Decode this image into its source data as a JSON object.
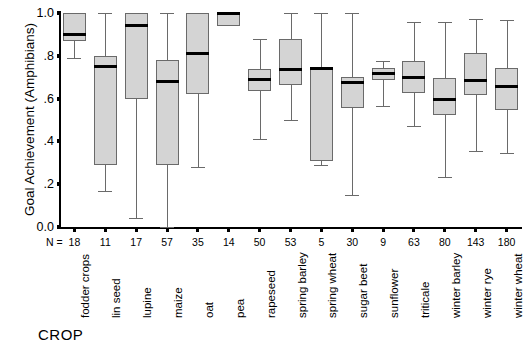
{
  "chart_data": {
    "type": "box",
    "title": "",
    "ylabel": "Goal Achievement (Amphibians)",
    "xlabel": "CROP",
    "ylim": [
      0.0,
      1.0
    ],
    "yticks": [
      "0.0",
      ".2",
      ".4",
      ".6",
      ".8",
      "1.0"
    ],
    "ytick_values": [
      0.0,
      0.2,
      0.4,
      0.6,
      0.8,
      1.0
    ],
    "grid": false,
    "legend": null,
    "n_prefix": "N =",
    "categories": [
      "fodder crops",
      "lin seed",
      "lupine",
      "maize",
      "oat",
      "pea",
      "rapeseed",
      "spring barley",
      "spring wheat",
      "sugar beet",
      "sunflower",
      "triticale",
      "winter barley",
      "winter rye",
      "winter wheat"
    ],
    "n": [
      18,
      11,
      17,
      57,
      35,
      14,
      50,
      53,
      5,
      30,
      9,
      63,
      80,
      143,
      180
    ],
    "boxes": [
      {
        "category": "fodder crops",
        "whisker_low": 0.79,
        "q1": 0.87,
        "median": 0.9,
        "q3": 1.0,
        "whisker_high": 1.0
      },
      {
        "category": "lin seed",
        "whisker_low": 0.17,
        "q1": 0.29,
        "median": 0.75,
        "q3": 0.8,
        "whisker_high": 1.0
      },
      {
        "category": "lupine",
        "whisker_low": 0.04,
        "q1": 0.6,
        "median": 0.94,
        "q3": 1.0,
        "whisker_high": 1.0
      },
      {
        "category": "maize",
        "whisker_low": 0.0,
        "q1": 0.29,
        "median": 0.68,
        "q3": 0.78,
        "whisker_high": 1.0
      },
      {
        "category": "oat",
        "whisker_low": 0.28,
        "q1": 0.62,
        "median": 0.81,
        "q3": 1.0,
        "whisker_high": 1.0
      },
      {
        "category": "pea",
        "whisker_low": 0.94,
        "q1": 0.94,
        "median": 1.0,
        "q3": 1.0,
        "whisker_high": 1.0
      },
      {
        "category": "rapeseed",
        "whisker_low": 0.41,
        "q1": 0.635,
        "median": 0.69,
        "q3": 0.74,
        "whisker_high": 0.88
      },
      {
        "category": "spring barley",
        "whisker_low": 0.5,
        "q1": 0.665,
        "median": 0.735,
        "q3": 0.88,
        "whisker_high": 1.0
      },
      {
        "category": "spring wheat",
        "whisker_low": 0.29,
        "q1": 0.31,
        "median": 0.74,
        "q3": 0.74,
        "whisker_high": 1.0
      },
      {
        "category": "sugar beet",
        "whisker_low": 0.15,
        "q1": 0.555,
        "median": 0.675,
        "q3": 0.7,
        "whisker_high": 1.0
      },
      {
        "category": "sunflower",
        "whisker_low": 0.565,
        "q1": 0.685,
        "median": 0.715,
        "q3": 0.745,
        "whisker_high": 0.775
      },
      {
        "category": "triticale",
        "whisker_low": 0.47,
        "q1": 0.625,
        "median": 0.7,
        "q3": 0.775,
        "whisker_high": 0.96
      },
      {
        "category": "winter barley",
        "whisker_low": 0.235,
        "q1": 0.525,
        "median": 0.595,
        "q3": 0.695,
        "whisker_high": 0.96
      },
      {
        "category": "winter rye",
        "whisker_low": 0.355,
        "q1": 0.615,
        "median": 0.685,
        "q3": 0.815,
        "whisker_high": 0.97
      },
      {
        "category": "winter wheat",
        "whisker_low": 0.345,
        "q1": 0.545,
        "median": 0.655,
        "q3": 0.745,
        "whisker_high": 0.965
      }
    ]
  }
}
